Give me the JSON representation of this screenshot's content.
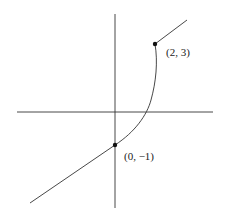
{
  "figure": {
    "type": "piecewise-function-graph",
    "points": [
      {
        "id": "p1",
        "label": "(0, −1)",
        "x": 0,
        "y": -1
      },
      {
        "id": "p2",
        "label": "(2, 3)",
        "x": 2,
        "y": 3
      }
    ],
    "segments": [
      {
        "kind": "line",
        "description": "ray ending at (0, -1) from lower-left"
      },
      {
        "kind": "curve",
        "description": "arc from (0, -1) to (2, 3)"
      },
      {
        "kind": "line",
        "description": "ray starting at (2, 3) toward upper-right"
      }
    ],
    "colors": {
      "stroke": "#333333",
      "background": "#ffffff"
    }
  }
}
